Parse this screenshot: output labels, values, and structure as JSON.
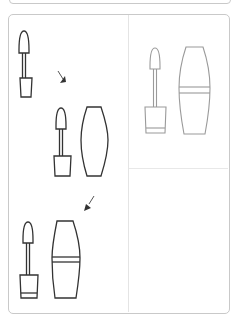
{
  "diagram": {
    "type": "assembly-instructions",
    "colors": {
      "line_dark": "#333333",
      "line_light": "#9a9a9a",
      "border": "#c9c9c9",
      "divider": "#e4e4e4",
      "background": "#ffffff"
    },
    "panels": [
      {
        "id": "assembly-steps",
        "steps": [
          {
            "step": 1,
            "parts": [
              "wand",
              "bottle"
            ],
            "icon": "wand-in-bottle-icon"
          },
          {
            "step": 2,
            "parts": [
              "wand",
              "bottle",
              "cap"
            ],
            "icon": "wand-and-cap-icon"
          },
          {
            "step": 3,
            "parts": [
              "wand",
              "bottle",
              "cap-with-band"
            ],
            "icon": "wand-and-banded-cap-icon"
          }
        ],
        "arrows": 2
      },
      {
        "id": "final-result",
        "parts": [
          "wand",
          "bottle",
          "cap-with-band"
        ],
        "style": "light-gray"
      },
      {
        "id": "empty-panel"
      }
    ]
  }
}
